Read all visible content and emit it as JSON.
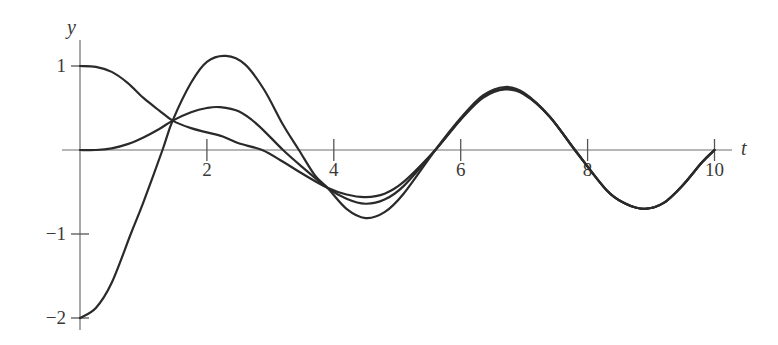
{
  "chart_data": {
    "type": "line",
    "title": "",
    "xlabel": "t",
    "ylabel": "y",
    "xlim": [
      0,
      10.3
    ],
    "ylim": [
      -2,
      1.3
    ],
    "grid": false,
    "legend": null,
    "x_ticks": [
      2,
      4,
      6,
      8,
      10
    ],
    "x_tick_labels": [
      "2",
      "4",
      "6",
      "8",
      "10"
    ],
    "y_ticks": [
      1,
      -1,
      -2
    ],
    "y_tick_labels": [
      "1",
      "−1",
      "−2"
    ],
    "series": [
      {
        "name": "y(0)=1",
        "x": [
          0,
          0.25,
          0.5,
          0.75,
          1.0,
          1.25,
          1.46,
          1.75,
          2.0,
          2.25,
          2.5,
          2.87,
          3.2,
          3.5,
          3.9,
          4.2,
          4.5,
          4.8,
          5.1,
          5.6,
          6.0,
          6.35,
          6.7,
          7.0,
          7.4,
          7.8,
          8.3,
          8.6,
          8.9,
          9.2,
          9.5,
          9.8,
          10.0
        ],
        "values": [
          1.0,
          0.99,
          0.93,
          0.8,
          0.62,
          0.47,
          0.35,
          0.26,
          0.21,
          0.16,
          0.08,
          0.0,
          -0.14,
          -0.28,
          -0.45,
          -0.53,
          -0.56,
          -0.52,
          -0.38,
          0.0,
          0.36,
          0.62,
          0.72,
          0.66,
          0.4,
          0.0,
          -0.48,
          -0.64,
          -0.7,
          -0.63,
          -0.42,
          -0.15,
          0.0
        ]
      },
      {
        "name": "y(0)=0",
        "x": [
          0,
          0.25,
          0.5,
          0.75,
          1.0,
          1.25,
          1.46,
          1.75,
          2.0,
          2.2,
          2.5,
          2.8,
          3.2,
          3.5,
          3.9,
          4.2,
          4.5,
          4.8,
          5.1,
          5.6,
          6.0,
          6.35,
          6.7,
          7.0,
          7.4,
          7.8,
          8.3,
          8.6,
          8.9,
          9.2,
          9.5,
          9.8,
          10.0
        ],
        "values": [
          0.0,
          0.0,
          0.02,
          0.07,
          0.15,
          0.25,
          0.35,
          0.45,
          0.5,
          0.51,
          0.46,
          0.3,
          0.0,
          -0.2,
          -0.45,
          -0.58,
          -0.64,
          -0.59,
          -0.43,
          0.0,
          0.37,
          0.63,
          0.73,
          0.67,
          0.4,
          0.0,
          -0.48,
          -0.64,
          -0.7,
          -0.63,
          -0.42,
          -0.15,
          0.0
        ]
      },
      {
        "name": "y(0)=-2",
        "x": [
          0,
          0.25,
          0.5,
          0.8,
          1.0,
          1.3,
          1.46,
          1.75,
          2.0,
          2.3,
          2.6,
          2.9,
          3.2,
          3.45,
          3.7,
          3.9,
          4.2,
          4.5,
          4.8,
          5.1,
          5.6,
          6.0,
          6.35,
          6.7,
          7.0,
          7.4,
          7.8,
          8.3,
          8.6,
          8.9,
          9.2,
          9.5,
          9.8,
          10.0
        ],
        "values": [
          -2.0,
          -1.88,
          -1.58,
          -1.0,
          -0.62,
          0.0,
          0.35,
          0.8,
          1.05,
          1.12,
          1.02,
          0.72,
          0.3,
          0.0,
          -0.3,
          -0.45,
          -0.7,
          -0.81,
          -0.74,
          -0.52,
          0.0,
          0.38,
          0.65,
          0.75,
          0.68,
          0.4,
          0.0,
          -0.48,
          -0.64,
          -0.7,
          -0.63,
          -0.42,
          -0.15,
          0.0
        ]
      }
    ],
    "annotations": []
  }
}
